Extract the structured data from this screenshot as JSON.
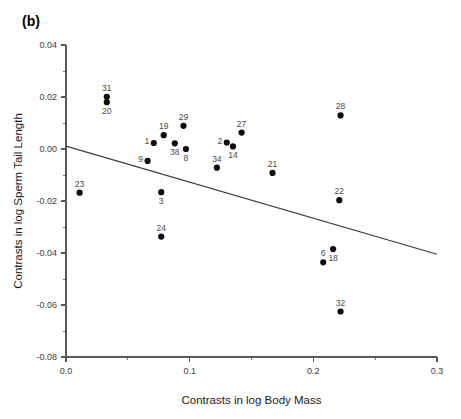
{
  "panel": {
    "label": "(b)"
  },
  "chart_data": {
    "type": "scatter",
    "title": "(b)",
    "xlabel": "Contrasts in log Body Mass",
    "ylabel": "Contrasts in log Sperm Tail Length",
    "xlim": [
      0.0,
      0.3
    ],
    "ylim": [
      -0.08,
      0.04
    ],
    "grid": false,
    "legend": null,
    "xticks": [
      "0.0",
      "0.1",
      "0.2",
      "0.3"
    ],
    "xtick_values": [
      0.0,
      0.1,
      0.2,
      0.3
    ],
    "xminor_values": [
      0.05,
      0.15,
      0.25
    ],
    "yticks": [
      "0.04",
      "0.02",
      "0.00",
      "-0.02",
      "-0.04",
      "-0.06",
      "-0.08"
    ],
    "ytick_values": [
      0.04,
      0.02,
      0.0,
      -0.02,
      -0.04,
      -0.06,
      -0.08
    ],
    "yminor_values": [
      0.03,
      0.01,
      -0.01,
      -0.03,
      -0.05,
      -0.07
    ],
    "points": [
      {
        "label": "23",
        "x": 0.011,
        "y": -0.0168,
        "label_pos": "above"
      },
      {
        "label": "31",
        "x": 0.033,
        "y": 0.0201,
        "label_pos": "above"
      },
      {
        "label": "20",
        "x": 0.033,
        "y": 0.018,
        "label_pos": "below"
      },
      {
        "label": "9",
        "x": 0.066,
        "y": -0.0046,
        "label_pos": "left"
      },
      {
        "label": "1",
        "x": 0.071,
        "y": 0.0023,
        "label_pos": "left"
      },
      {
        "label": "19",
        "x": 0.079,
        "y": 0.0053,
        "label_pos": "above"
      },
      {
        "label": "3",
        "x": 0.077,
        "y": -0.0166,
        "label_pos": "below"
      },
      {
        "label": "24",
        "x": 0.077,
        "y": -0.0337,
        "label_pos": "above"
      },
      {
        "label": "38",
        "x": 0.088,
        "y": 0.0022,
        "label_pos": "below"
      },
      {
        "label": "29",
        "x": 0.095,
        "y": 0.0089,
        "label_pos": "above"
      },
      {
        "label": "8",
        "x": 0.097,
        "y": 0.0,
        "label_pos": "below"
      },
      {
        "label": "34",
        "x": 0.122,
        "y": -0.0072,
        "label_pos": "above"
      },
      {
        "label": "2",
        "x": 0.13,
        "y": 0.0025,
        "label_pos": "left"
      },
      {
        "label": "14",
        "x": 0.135,
        "y": 0.001,
        "label_pos": "below"
      },
      {
        "label": "27",
        "x": 0.142,
        "y": 0.0063,
        "label_pos": "above"
      },
      {
        "label": "21",
        "x": 0.167,
        "y": -0.0092,
        "label_pos": "above"
      },
      {
        "label": "28",
        "x": 0.222,
        "y": 0.0129,
        "label_pos": "above"
      },
      {
        "label": "22",
        "x": 0.221,
        "y": -0.0197,
        "label_pos": "above"
      },
      {
        "label": "6",
        "x": 0.208,
        "y": -0.0436,
        "label_pos": "above"
      },
      {
        "label": "18",
        "x": 0.216,
        "y": -0.0385,
        "label_pos": "below"
      },
      {
        "label": "32",
        "x": 0.222,
        "y": -0.0625,
        "label_pos": "above"
      }
    ],
    "fit_line": {
      "x0": 0.0,
      "y0": 0.0011,
      "x1": 0.3,
      "y1": -0.0405
    }
  }
}
